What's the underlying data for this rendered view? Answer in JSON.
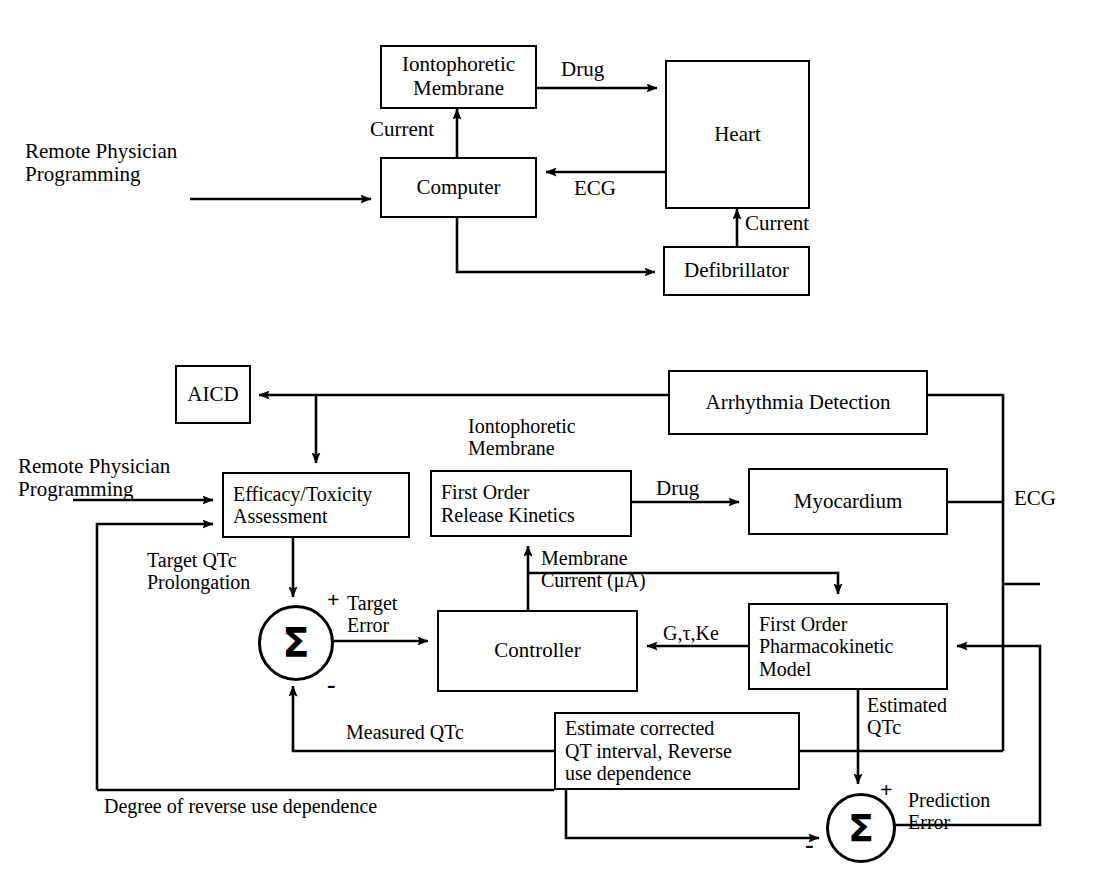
{
  "figure": {
    "background_color": "#ffffff",
    "line_color": "#000000",
    "type": "block-diagram"
  },
  "top_diagram": {
    "name": "Closed-loop iontophoretic drug delivery with defibrillator",
    "blocks": [
      {
        "id": "iontophoretic-membrane",
        "label": "Iontophoretic\nMembrane"
      },
      {
        "id": "computer",
        "label": "Computer"
      },
      {
        "id": "heart",
        "label": "Heart"
      },
      {
        "id": "defibrillator",
        "label": "Defibrillator"
      }
    ],
    "signals": [
      {
        "id": "remote-physician-programming",
        "label": "Remote Physician\nProgramming"
      },
      {
        "id": "current-to-membrane",
        "label": "Current"
      },
      {
        "id": "drug",
        "label": "Drug"
      },
      {
        "id": "ecg",
        "label": "ECG"
      },
      {
        "id": "current-to-heart",
        "label": "Current"
      }
    ]
  },
  "bottom_diagram": {
    "name": "Detailed closed-loop QTc control model",
    "blocks": [
      {
        "id": "aicd",
        "label": "AICD"
      },
      {
        "id": "arrhythmia-detection",
        "label": "Arrhythmia Detection"
      },
      {
        "id": "efficacy-toxicity-assessment",
        "label": "Efficacy/Toxicity\nAssessment"
      },
      {
        "id": "first-order-release-kinetics",
        "label": "First Order\nRelease Kinetics"
      },
      {
        "id": "myocardium",
        "label": "Myocardium"
      },
      {
        "id": "controller",
        "label": "Controller"
      },
      {
        "id": "first-order-pharmacokinetic-model",
        "label": "First Order\nPharmacokinetic\nModel"
      },
      {
        "id": "estimate-corrected-qt",
        "label": "Estimate corrected\nQT interval, Reverse\nuse dependence"
      }
    ],
    "sum_nodes": [
      {
        "id": "target-error-sum",
        "glyph": "Σ",
        "signs": {
          "top": "+",
          "bottom": "-"
        }
      },
      {
        "id": "prediction-error-sum",
        "glyph": "Σ",
        "signs": {
          "top": "+",
          "bottom": "-"
        }
      }
    ],
    "signals": [
      {
        "id": "remote-physician-programming",
        "label": "Remote Physician\nProgramming"
      },
      {
        "id": "iontophoretic-membrane-caption",
        "label": "Iontophoretic\nMembrane"
      },
      {
        "id": "drug",
        "label": "Drug"
      },
      {
        "id": "ecg",
        "label": "ECG"
      },
      {
        "id": "target-qtc-prolongation",
        "label": "Target QTc\nProlongation"
      },
      {
        "id": "target-error",
        "label": "Target\nError"
      },
      {
        "id": "membrane-current",
        "label": "Membrane\nCurrent (μA)"
      },
      {
        "id": "gain-tau-ke",
        "label": "G,τ,Ke"
      },
      {
        "id": "estimated-qtc",
        "label": "Estimated\nQTc"
      },
      {
        "id": "measured-qtc",
        "label": "Measured QTc"
      },
      {
        "id": "degree-of-reverse-use-dependence",
        "label": "Degree of reverse use dependence"
      },
      {
        "id": "prediction-error",
        "label": "Prediction\nError"
      }
    ]
  }
}
